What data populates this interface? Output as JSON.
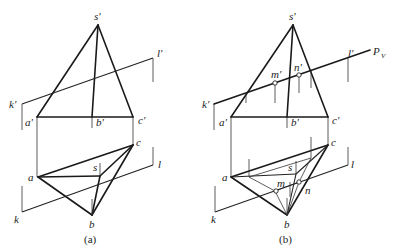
{
  "figure": {
    "panels": [
      {
        "caption": "(a)",
        "labels": {
          "s_prime": "s'",
          "l_prime": "l'",
          "k_prime": "k'",
          "a_prime": "a'",
          "b_prime": "b'",
          "c_prime": "c'",
          "a": "a",
          "b": "b",
          "c": "c",
          "s": "s",
          "k": "k",
          "l": "l"
        }
      },
      {
        "caption": "(b)",
        "labels": {
          "s_prime": "s'",
          "l_prime": "l'",
          "k_prime": "k'",
          "P_V": "P",
          "P_V_sub": "V",
          "m_prime": "m'",
          "n_prime": "n'",
          "a_prime": "a'",
          "b_prime": "b'",
          "c_prime": "c'",
          "a": "a",
          "b": "b",
          "c": "c",
          "s": "s",
          "k": "k",
          "l": "l",
          "m": "m",
          "n": "n"
        }
      }
    ]
  }
}
